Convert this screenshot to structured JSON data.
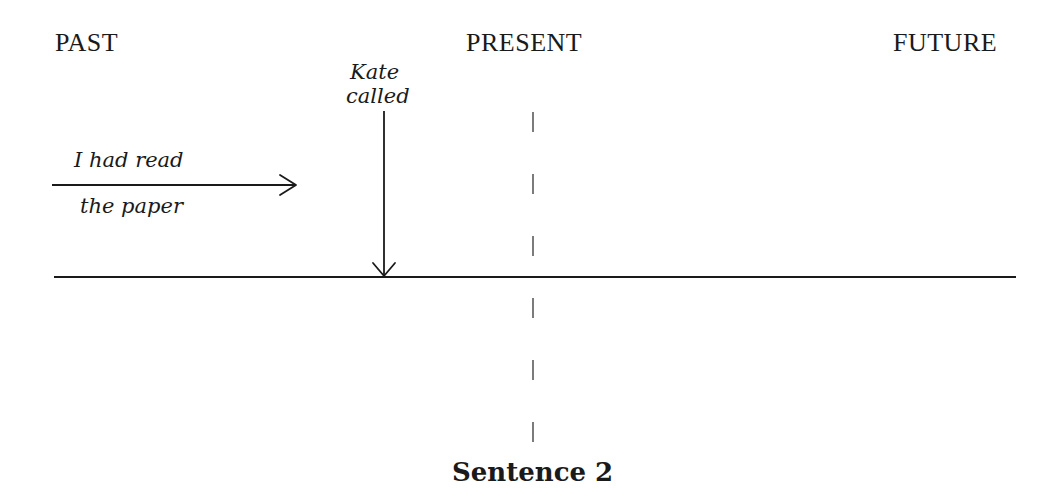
{
  "diagram": {
    "headings": {
      "past": "PAST",
      "present": "PRESENT",
      "future": "FUTURE"
    },
    "events": {
      "kate_called": {
        "line1": "Kate",
        "line2": "called"
      },
      "had_read": {
        "line1": "I had read",
        "line2": "the paper"
      }
    },
    "caption": "Sentence 2",
    "colors": {
      "ink": "#1a1a1a",
      "background": "#ffffff"
    }
  }
}
